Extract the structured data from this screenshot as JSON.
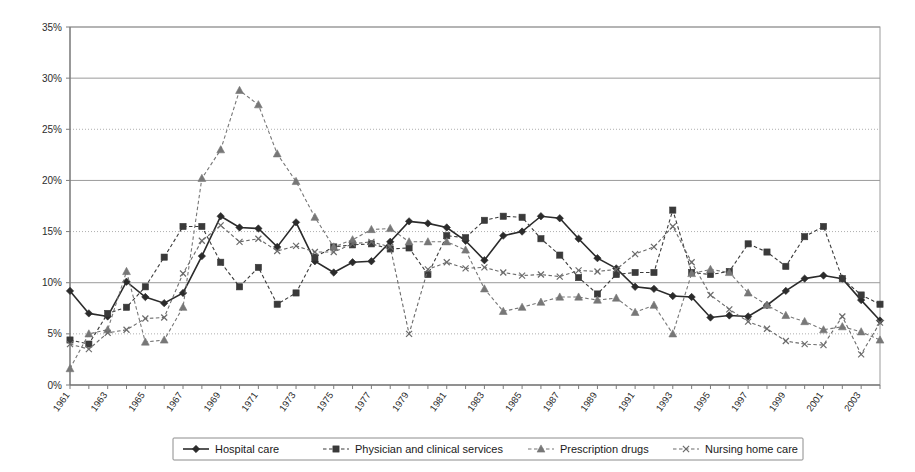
{
  "chart_data": {
    "type": "line",
    "title": "",
    "subtitle": "",
    "xlabel": "",
    "ylabel": "",
    "ylim": [
      0,
      35
    ],
    "y_tick_labels": [
      "0%",
      "5%",
      "10%",
      "15%",
      "20%",
      "25%",
      "30%",
      "35%"
    ],
    "y_ticks": [
      0,
      5,
      10,
      15,
      20,
      25,
      30,
      35
    ],
    "grid": true,
    "grid_axis": "y",
    "legend_position": "bottom",
    "x": [
      1961,
      1962,
      1963,
      1964,
      1965,
      1966,
      1967,
      1968,
      1969,
      1970,
      1971,
      1972,
      1973,
      1974,
      1975,
      1976,
      1977,
      1978,
      1979,
      1980,
      1981,
      1982,
      1983,
      1984,
      1985,
      1986,
      1987,
      1988,
      1989,
      1990,
      1991,
      1992,
      1993,
      1994,
      1995,
      1996,
      1997,
      1998,
      1999,
      2000,
      2001,
      2002,
      2003,
      2004
    ],
    "x_tick_labels": [
      "1961",
      "1963",
      "1965",
      "1967",
      "1969",
      "1971",
      "1973",
      "1975",
      "1977",
      "1979",
      "1981",
      "1983",
      "1985",
      "1987",
      "1989",
      "1991",
      "1993",
      "1995",
      "1997",
      "1999",
      "2001",
      "2003"
    ],
    "series": [
      {
        "name": "Hospital care",
        "marker": "diamond",
        "line_style": "solid",
        "color": "#2b2b2b",
        "values": [
          9.2,
          7.0,
          6.7,
          10.1,
          8.6,
          8.0,
          9.0,
          12.6,
          16.5,
          15.4,
          15.3,
          13.5,
          15.9,
          12.1,
          11.0,
          12.0,
          12.1,
          14.0,
          16.0,
          15.8,
          15.4,
          14.1,
          12.2,
          14.6,
          15.0,
          16.5,
          16.3,
          14.3,
          12.4,
          11.4,
          9.6,
          9.4,
          8.7,
          8.6,
          6.6,
          6.8,
          6.7,
          7.8,
          9.2,
          10.4,
          10.7,
          10.4,
          8.3,
          6.3
        ]
      },
      {
        "name": "Physician and clinical services",
        "marker": "square",
        "line_style": "dashed",
        "color": "#3a3a3a",
        "values": [
          4.4,
          4.0,
          7.0,
          7.6,
          9.6,
          12.5,
          15.5,
          15.5,
          12.0,
          9.6,
          11.5,
          7.9,
          9.0,
          12.5,
          13.5,
          13.7,
          13.8,
          13.3,
          13.4,
          10.8,
          14.6,
          14.4,
          16.1,
          16.5,
          16.4,
          14.3,
          12.7,
          10.5,
          8.9,
          10.8,
          11.0,
          11.0,
          17.1,
          11.0,
          10.8,
          11.1,
          13.8,
          13.0,
          11.6,
          14.5,
          15.5,
          10.4,
          8.8,
          7.9
        ]
      },
      {
        "name": "Prescription drugs",
        "marker": "triangle",
        "line_style": "dashed",
        "color": "#777777",
        "values": [
          1.6,
          5.0,
          5.4,
          11.1,
          4.2,
          4.4,
          7.6,
          20.2,
          23.0,
          28.8,
          27.4,
          22.6,
          19.9,
          16.4,
          13.5,
          14.2,
          15.2,
          15.3,
          14.0,
          14.0,
          14.0,
          13.2,
          9.4,
          7.2,
          7.6,
          8.1,
          8.6,
          8.6,
          8.3,
          8.5,
          7.1,
          7.8,
          5.0,
          10.9,
          11.3,
          11.0,
          9.0,
          7.8,
          6.8,
          6.2,
          5.4,
          5.7,
          5.2,
          4.4
        ]
      },
      {
        "name": "Nursing home care",
        "marker": "x",
        "line_style": "dashed",
        "color": "#6b6b6b",
        "values": [
          4.0,
          3.5,
          5.1,
          5.4,
          6.5,
          6.6,
          10.9,
          14.1,
          15.6,
          14.0,
          14.3,
          13.1,
          13.6,
          13.0,
          13.0,
          13.8,
          14.0,
          13.5,
          5.0,
          11.3,
          12.0,
          11.4,
          11.5,
          11.0,
          10.7,
          10.8,
          10.6,
          11.2,
          11.1,
          11.3,
          12.8,
          13.5,
          15.5,
          12.0,
          8.8,
          7.4,
          6.2,
          5.5,
          4.3,
          4.0,
          3.9,
          6.7,
          3.0,
          6.1
        ]
      }
    ]
  },
  "legend": {
    "items": [
      {
        "label": "Hospital care"
      },
      {
        "label": "Physician and clinical services"
      },
      {
        "label": "Prescription drugs"
      },
      {
        "label": "Nursing home care"
      }
    ]
  }
}
